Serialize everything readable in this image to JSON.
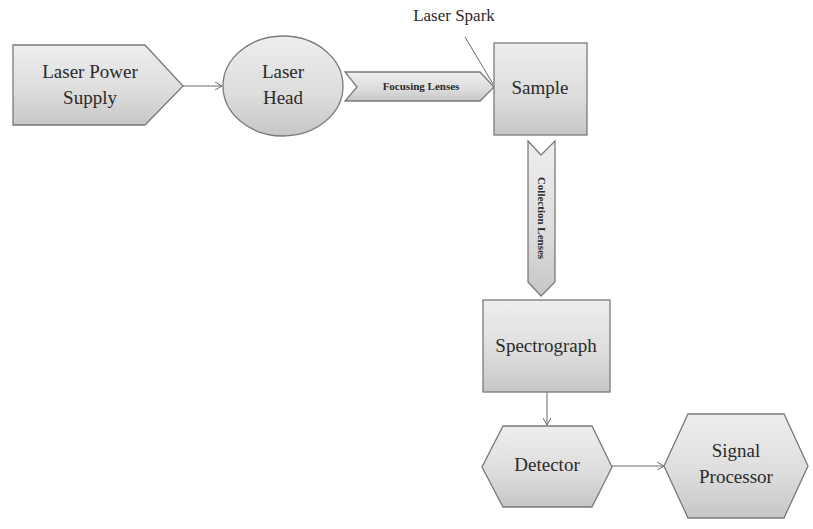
{
  "diagram": {
    "nodes": {
      "power_supply": {
        "line1": "Laser Power",
        "line2": "Supply"
      },
      "laser_head": {
        "line1": "Laser",
        "line2": "Head"
      },
      "sample": {
        "label": "Sample"
      },
      "spectrograph": {
        "label": "Spectrograph"
      },
      "detector": {
        "label": "Detector"
      },
      "signal_processor": {
        "line1": "Signal",
        "line2": "Processor"
      }
    },
    "connectors": {
      "focusing_lenses": "Focusing Lenses",
      "collection_lenses": "Collection Lenses"
    },
    "annotations": {
      "laser_spark": "Laser Spark"
    },
    "edges": [
      {
        "from": "Laser Power Supply",
        "to": "Laser Head"
      },
      {
        "from": "Laser Head",
        "to": "Sample",
        "via": "Focusing Lenses"
      },
      {
        "from": "Sample",
        "to": "Spectrograph",
        "via": "Collection Lenses"
      },
      {
        "from": "Spectrograph",
        "to": "Detector"
      },
      {
        "from": "Detector",
        "to": "Signal Processor"
      }
    ]
  }
}
